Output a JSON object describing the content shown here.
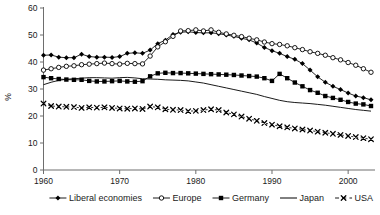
{
  "chart_data": {
    "type": "line",
    "title": "",
    "xlabel": "",
    "ylabel": "%",
    "xlim": [
      1960,
      2003
    ],
    "ylim": [
      0,
      60
    ],
    "ytick_values": [
      0,
      10,
      20,
      30,
      40,
      50,
      60
    ],
    "ytick_labels": [
      "0",
      "10",
      "20",
      "30",
      "40",
      "50",
      "60"
    ],
    "xtick_values": [
      1960,
      1970,
      1980,
      1990,
      2000
    ],
    "xtick_labels": [
      "1960",
      "1970",
      "1980",
      "1990",
      "2000"
    ],
    "grid": false,
    "legend_position": "bottom",
    "x": [
      1960,
      1961,
      1962,
      1963,
      1964,
      1965,
      1966,
      1967,
      1968,
      1969,
      1970,
      1971,
      1972,
      1973,
      1974,
      1975,
      1976,
      1977,
      1978,
      1979,
      1980,
      1981,
      1982,
      1983,
      1984,
      1985,
      1986,
      1987,
      1988,
      1989,
      1990,
      1991,
      1992,
      1993,
      1994,
      1995,
      1996,
      1997,
      1998,
      1999,
      2000,
      2001,
      2002,
      2003
    ],
    "series": [
      {
        "name": "Liberal economies",
        "marker": "filled-diamond",
        "line_style": "solid",
        "color": "#000000",
        "values": [
          42.5,
          42.6,
          41.8,
          41.6,
          41.6,
          42.9,
          42.0,
          41.8,
          41.8,
          41.7,
          42.0,
          43.2,
          43.4,
          43.2,
          44.4,
          46.8,
          48.1,
          50.2,
          51.0,
          51.2,
          50.9,
          50.8,
          50.8,
          50.5,
          50.0,
          49.5,
          48.8,
          48.2,
          47.0,
          45.4,
          44.2,
          43.2,
          42.0,
          41.0,
          39.4,
          37.0,
          34.5,
          32.5,
          31.0,
          29.8,
          28.5,
          27.4,
          26.8,
          26.0
        ]
      },
      {
        "name": "Europe",
        "marker": "open-circle",
        "line_style": "solid",
        "color": "#000000",
        "values": [
          37.0,
          37.5,
          38.0,
          38.4,
          38.6,
          39.0,
          39.2,
          39.4,
          39.6,
          39.4,
          39.2,
          39.5,
          39.4,
          39.3,
          42.2,
          45.6,
          47.5,
          49.5,
          51.5,
          51.6,
          51.9,
          51.5,
          51.9,
          51.0,
          50.4,
          49.9,
          49.4,
          48.8,
          48.2,
          47.4,
          46.8,
          46.5,
          46.0,
          45.3,
          44.6,
          43.8,
          43.2,
          42.5,
          41.6,
          40.8,
          39.8,
          38.8,
          37.5,
          36.2
        ]
      },
      {
        "name": "Germany",
        "marker": "filled-square",
        "line_style": "solid",
        "color": "#000000",
        "values": [
          34.4,
          34.0,
          33.7,
          33.5,
          33.4,
          33.4,
          33.0,
          32.8,
          32.8,
          32.9,
          33.0,
          32.8,
          32.7,
          32.9,
          34.7,
          35.8,
          36.0,
          35.9,
          35.9,
          35.8,
          35.7,
          35.6,
          35.5,
          35.4,
          35.3,
          35.2,
          35.0,
          34.8,
          34.6,
          34.0,
          33.0,
          35.6,
          34.0,
          32.4,
          31.0,
          29.6,
          28.6,
          27.4,
          26.7,
          26.0,
          25.2,
          24.6,
          24.3,
          23.7
        ]
      },
      {
        "name": "Japan",
        "marker": "none",
        "line_style": "solid",
        "color": "#000000",
        "values": [
          31.6,
          32.5,
          33.2,
          33.6,
          33.8,
          34.0,
          34.2,
          34.2,
          34.1,
          34.0,
          34.2,
          34.3,
          34.1,
          33.8,
          33.7,
          33.6,
          33.4,
          33.3,
          33.2,
          33.0,
          32.6,
          32.2,
          31.6,
          31.0,
          30.4,
          29.8,
          29.2,
          28.6,
          28.0,
          27.2,
          26.5,
          25.8,
          25.3,
          25.0,
          24.8,
          24.6,
          24.3,
          24.0,
          23.6,
          23.2,
          22.8,
          22.4,
          22.1,
          21.8
        ]
      },
      {
        "name": "USA",
        "marker": "cross-x",
        "line_style": "dashed",
        "color": "#000000",
        "values": [
          24.6,
          23.7,
          23.5,
          23.4,
          23.3,
          23.0,
          23.2,
          23.1,
          23.2,
          23.0,
          22.8,
          22.7,
          22.8,
          22.6,
          23.5,
          23.2,
          22.5,
          22.3,
          22.2,
          21.8,
          21.9,
          22.2,
          22.5,
          22.2,
          21.3,
          20.6,
          19.8,
          19.0,
          18.2,
          17.4,
          16.8,
          16.2,
          15.8,
          15.4,
          15.0,
          14.6,
          14.2,
          13.8,
          13.4,
          13.0,
          12.6,
          12.2,
          11.8,
          11.4
        ]
      }
    ]
  },
  "legend": {
    "items": [
      {
        "label": "Liberal economies",
        "marker": "filled-diamond"
      },
      {
        "label": "Europe",
        "marker": "open-circle"
      },
      {
        "label": "Germany",
        "marker": "filled-square"
      },
      {
        "label": "Japan",
        "marker": "none"
      },
      {
        "label": "USA",
        "marker": "cross-x"
      }
    ]
  }
}
